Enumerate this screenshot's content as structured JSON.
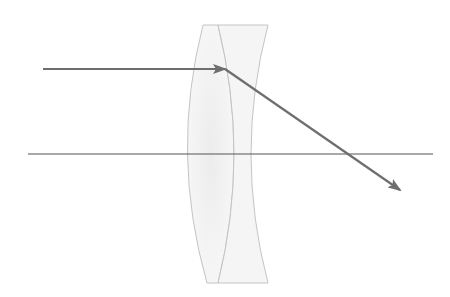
{
  "diagram": {
    "title": "",
    "colors": {
      "background": "#ffffff",
      "ray": "#6e6e6e",
      "axis": "#555555",
      "lens_outline": "#c4c4c4",
      "lens_fill": "#f3f3f3"
    },
    "optical_axis": {
      "x1": 28,
      "y1": 154,
      "x2": 433,
      "y2": 154
    },
    "incident_ray": {
      "x1": 43,
      "y1": 69,
      "x2": 225,
      "y2": 69,
      "arrow": "end"
    },
    "refracted_ray": {
      "x1": 225,
      "y1": 69,
      "x2": 400,
      "y2": 190,
      "arrow": "end"
    },
    "lenses": [
      {
        "name": "convex-lens",
        "type": "biconvex",
        "top_y": 25,
        "bottom_y": 283,
        "left_mid_x": 190,
        "right_mid_x": 234
      },
      {
        "name": "concave-lens",
        "type": "concave",
        "top_y": 25,
        "bottom_y": 283,
        "left_mid_x": 234,
        "right_edge_x": 268,
        "right_mid_x": 251
      }
    ]
  }
}
